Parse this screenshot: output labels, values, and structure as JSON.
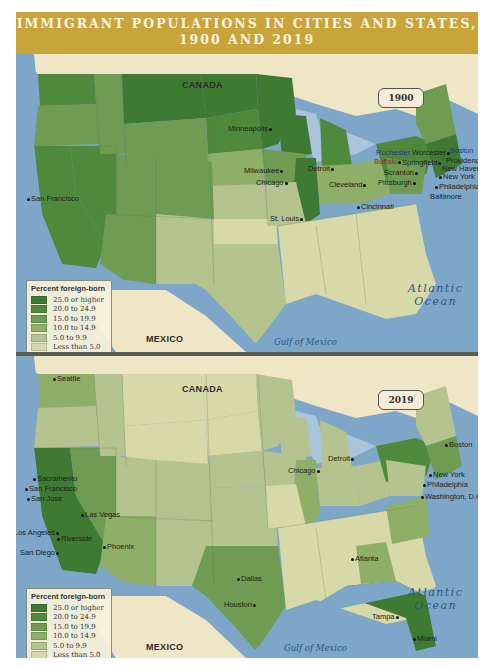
{
  "title": {
    "line1": "IMMIGRANT POPULATIONS IN CITIES AND STATES,",
    "line2": "1900 AND 2019"
  },
  "colors": {
    "title_bar": "#c9a43a",
    "water": "#7ea6c9",
    "land_outside_us": "#efe6c6",
    "legend_25_plus": "#3f7a32",
    "legend_20_24_9": "#4f8a3c",
    "legend_15_19_9": "#6f9c52",
    "legend_10_14_9": "#8fae68",
    "legend_5_9_9": "#b5c48e",
    "legend_under_5": "#d8d9a8"
  },
  "legend": {
    "title": "Percent foreign-born",
    "items": [
      {
        "label": "25.0 or higher",
        "color": "#3f7a32"
      },
      {
        "label": "20.0 to 24.9",
        "color": "#4f8a3c"
      },
      {
        "label": "15.0 to 19.9",
        "color": "#6f9c52"
      },
      {
        "label": "10.0 to 14.9",
        "color": "#8fae68"
      },
      {
        "label": "5.0 to 9.9",
        "color": "#b5c48e"
      },
      {
        "label": "Less than 5.0",
        "color": "#d8d9a8"
      }
    ]
  },
  "maps": [
    {
      "year": "1900",
      "labels": {
        "canada": "CANADA",
        "mexico": "MEXICO",
        "atlantic_line1": "Atlantic",
        "atlantic_line2": "Ocean",
        "gulf": "Gulf of Mexico"
      },
      "cities": [
        "San Francisco",
        "Minneapolis",
        "Milwaukee",
        "Chicago",
        "Detroit",
        "St. Louis",
        "Cleveland",
        "Cincinnati",
        "Pittsburgh",
        "Rochester",
        "Buffalo",
        "Scranton",
        "Springfield",
        "Worcester",
        "Boston",
        "Providence",
        "New Haven",
        "New York",
        "Philadelphia",
        "Baltimore"
      ]
    },
    {
      "year": "2019",
      "labels": {
        "canada": "CANADA",
        "mexico": "MEXICO",
        "atlantic_line1": "Atlantic",
        "atlantic_line2": "Ocean",
        "gulf": "Gulf of Mexico"
      },
      "cities": [
        "Seattle",
        "Sacramento",
        "San Francisco",
        "San Jose",
        "Las Vegas",
        "Los Angeles",
        "Riverside",
        "San Diego",
        "Phoenix",
        "Dallas",
        "Houston",
        "Chicago",
        "Detroit",
        "Atlanta",
        "Tampa",
        "Miami",
        "Boston",
        "New York",
        "Philadelphia",
        "Washington, D.C."
      ]
    }
  ]
}
